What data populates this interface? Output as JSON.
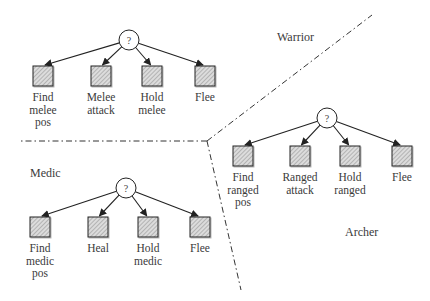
{
  "diagram": {
    "type": "behavior-tree-regions",
    "colors": {
      "line": "#222222",
      "node_fill": "#d9d9d9",
      "hatch": "#8a8a8a",
      "divider": "#333333"
    },
    "regions": [
      {
        "name": "Warrior",
        "root": {
          "symbol": "?",
          "x": 129,
          "y": 40
        },
        "children": [
          {
            "label": "Find\nmelee\npos",
            "x": 43
          },
          {
            "label": "Melee\nattack",
            "x": 101
          },
          {
            "label": "Hold\nmelee",
            "x": 152
          },
          {
            "label": "Flee",
            "x": 205
          }
        ],
        "child_y": 66,
        "label_pos": {
          "x": 277,
          "y": 30
        }
      },
      {
        "name": "Archer",
        "root": {
          "symbol": "?",
          "x": 327,
          "y": 118
        },
        "children": [
          {
            "label": "Find\nranged\npos",
            "x": 243
          },
          {
            "label": "Ranged\nattack",
            "x": 300
          },
          {
            "label": "Hold\nranged",
            "x": 350
          },
          {
            "label": "Flee",
            "x": 402
          }
        ],
        "child_y": 146,
        "label_pos": {
          "x": 345,
          "y": 225
        }
      },
      {
        "name": "Medic",
        "root": {
          "symbol": "?",
          "x": 126,
          "y": 188
        },
        "children": [
          {
            "label": "Find\nmedic\npos",
            "x": 40
          },
          {
            "label": "Heal",
            "x": 98
          },
          {
            "label": "Hold\nmedic",
            "x": 148
          },
          {
            "label": "Flee",
            "x": 200
          }
        ],
        "child_y": 217,
        "label_pos": {
          "x": 30,
          "y": 166
        }
      }
    ],
    "dividers": {
      "junction": {
        "x": 207,
        "y": 141
      },
      "ends": [
        {
          "x": 18,
          "y": 141
        },
        {
          "x": 372,
          "y": 15
        },
        {
          "x": 241,
          "y": 290
        }
      ]
    }
  }
}
